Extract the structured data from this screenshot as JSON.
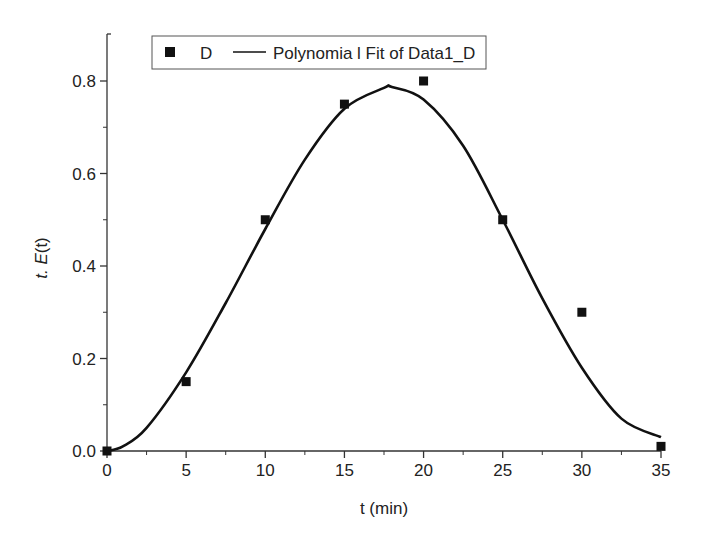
{
  "chart_data": {
    "type": "scatter",
    "title": "",
    "xlabel": "t (min)",
    "ylabel_prefix": "t. ",
    "ylabel_main": "E",
    "ylabel_arg": "(t)",
    "ylabel": "t. E(t)",
    "xlim": [
      0,
      35
    ],
    "ylim": [
      0,
      0.9
    ],
    "grid": false,
    "legend_position": "top-center",
    "x_ticks": [
      0,
      5,
      10,
      15,
      20,
      25,
      30,
      35
    ],
    "x_tick_labels": [
      "0",
      "5",
      "10",
      "15",
      "20",
      "25",
      "30",
      "35"
    ],
    "y_ticks": [
      0.0,
      0.2,
      0.4,
      0.6,
      0.8
    ],
    "y_tick_labels": [
      "0.0",
      "0.2",
      "0.4",
      "0.6",
      "0.8"
    ],
    "series": [
      {
        "name": "D",
        "type": "scatter",
        "marker": "square",
        "x": [
          0,
          5,
          10,
          15,
          20,
          25,
          30,
          35
        ],
        "y": [
          0.0,
          0.15,
          0.5,
          0.75,
          0.8,
          0.5,
          0.3,
          0.01
        ]
      },
      {
        "name": "Polynomia l Fit of Data1_D",
        "type": "line",
        "x": [
          0,
          1,
          2.5,
          5,
          7.5,
          10,
          12.5,
          15,
          17.5,
          18,
          20,
          22.5,
          25,
          27.5,
          30,
          32.5,
          35
        ],
        "y": [
          0.0,
          0.01,
          0.05,
          0.17,
          0.32,
          0.48,
          0.63,
          0.74,
          0.785,
          0.787,
          0.76,
          0.66,
          0.5,
          0.33,
          0.18,
          0.07,
          0.03
        ]
      }
    ]
  },
  "legend": {
    "scatter_label": "D",
    "line_label": "Polynomia l Fit of Data1_D"
  },
  "colors": {
    "ink": "#111111",
    "axis": "#333333",
    "background": "#ffffff"
  }
}
